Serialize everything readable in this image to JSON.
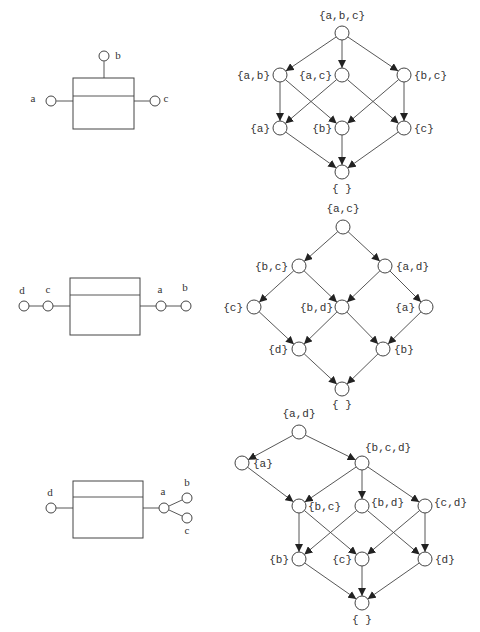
{
  "figures": [
    {
      "id": "fig1",
      "component": {
        "box": {
          "x": 73,
          "y": 78,
          "w": 61,
          "h": 51,
          "divider_y": 96
        },
        "ports": [
          {
            "name": "a",
            "x": 51,
            "y": 101,
            "label_x": 33,
            "label_y": 102,
            "attach": {
              "x": 73,
              "y": 101
            }
          },
          {
            "name": "b",
            "x": 104,
            "y": 56,
            "label_x": 118,
            "label_y": 59,
            "attach": {
              "x": 104,
              "y": 78
            }
          },
          {
            "name": "c",
            "x": 155,
            "y": 101,
            "label_x": 166,
            "label_y": 102,
            "attach": {
              "x": 134,
              "y": 101
            }
          }
        ],
        "chains": []
      },
      "lattice": {
        "nodes": [
          {
            "id": "abc",
            "label": "{a,b,c}",
            "x": 342,
            "y": 33,
            "lx": 342,
            "ly": 19,
            "anchor": "middle"
          },
          {
            "id": "ab",
            "label": "{a,b}",
            "x": 280,
            "y": 75,
            "lx": 270,
            "ly": 79,
            "anchor": "end"
          },
          {
            "id": "ac",
            "label": "{a,c}",
            "x": 342,
            "y": 75,
            "lx": 332,
            "ly": 79,
            "anchor": "end"
          },
          {
            "id": "bc",
            "label": "{b,c}",
            "x": 404,
            "y": 75,
            "lx": 414,
            "ly": 79,
            "anchor": "start"
          },
          {
            "id": "a",
            "label": "{a}",
            "x": 280,
            "y": 128,
            "lx": 270,
            "ly": 132,
            "anchor": "end"
          },
          {
            "id": "b",
            "label": "{b}",
            "x": 342,
            "y": 128,
            "lx": 332,
            "ly": 132,
            "anchor": "end"
          },
          {
            "id": "c",
            "label": "{c}",
            "x": 404,
            "y": 128,
            "lx": 414,
            "ly": 132,
            "anchor": "start"
          },
          {
            "id": "empty",
            "label": "{ }",
            "x": 342,
            "y": 172,
            "lx": 342,
            "ly": 192,
            "anchor": "middle"
          }
        ],
        "edges": [
          [
            "abc",
            "ab"
          ],
          [
            "abc",
            "ac"
          ],
          [
            "abc",
            "bc"
          ],
          [
            "ab",
            "a"
          ],
          [
            "ab",
            "b"
          ],
          [
            "ac",
            "a"
          ],
          [
            "ac",
            "c"
          ],
          [
            "bc",
            "b"
          ],
          [
            "bc",
            "c"
          ],
          [
            "a",
            "empty"
          ],
          [
            "b",
            "empty"
          ],
          [
            "c",
            "empty"
          ]
        ]
      }
    },
    {
      "id": "fig2",
      "component": {
        "box": {
          "x": 70,
          "y": 278,
          "w": 70,
          "h": 57,
          "divider_y": 295
        },
        "ports": [
          {
            "name": "d",
            "x": 24,
            "y": 306,
            "label_x": 22,
            "label_y": 294
          },
          {
            "name": "c",
            "x": 48,
            "y": 306,
            "label_x": 48,
            "label_y": 293
          },
          {
            "name": "a",
            "x": 161,
            "y": 306,
            "label_x": 160,
            "label_y": 293
          },
          {
            "name": "b",
            "x": 186,
            "y": 306,
            "label_x": 185,
            "label_y": 291
          }
        ],
        "chains": [
          {
            "x1": 29,
            "y1": 306,
            "x2": 43,
            "y2": 306
          },
          {
            "x1": 53,
            "y1": 306,
            "x2": 70,
            "y2": 306
          },
          {
            "x1": 140,
            "y1": 306,
            "x2": 156,
            "y2": 306
          },
          {
            "x1": 166,
            "y1": 306,
            "x2": 181,
            "y2": 306
          }
        ]
      },
      "lattice": {
        "nodes": [
          {
            "id": "ac",
            "label": "{a,c}",
            "x": 343,
            "y": 227,
            "lx": 343,
            "ly": 212,
            "anchor": "middle"
          },
          {
            "id": "bc",
            "label": "{b,c}",
            "x": 299,
            "y": 266,
            "lx": 288,
            "ly": 270,
            "anchor": "end"
          },
          {
            "id": "ad",
            "label": "{a,d}",
            "x": 385,
            "y": 266,
            "lx": 396,
            "ly": 270,
            "anchor": "start"
          },
          {
            "id": "c",
            "label": "{c}",
            "x": 254,
            "y": 307,
            "lx": 243,
            "ly": 311,
            "anchor": "end"
          },
          {
            "id": "bd",
            "label": "{b,d}",
            "x": 342,
            "y": 307,
            "lx": 333,
            "ly": 311,
            "anchor": "end"
          },
          {
            "id": "a",
            "label": "{a}",
            "x": 426,
            "y": 307,
            "lx": 415,
            "ly": 311,
            "anchor": "end"
          },
          {
            "id": "d",
            "label": "{d}",
            "x": 299,
            "y": 349,
            "lx": 288,
            "ly": 353,
            "anchor": "end"
          },
          {
            "id": "b",
            "label": "{b}",
            "x": 383,
            "y": 349,
            "lx": 394,
            "ly": 353,
            "anchor": "start"
          },
          {
            "id": "empty",
            "label": "{ }",
            "x": 342,
            "y": 389,
            "lx": 342,
            "ly": 408,
            "anchor": "middle"
          }
        ],
        "edges": [
          [
            "ac",
            "bc"
          ],
          [
            "ac",
            "ad"
          ],
          [
            "bc",
            "c"
          ],
          [
            "bc",
            "bd"
          ],
          [
            "ad",
            "bd"
          ],
          [
            "ad",
            "a"
          ],
          [
            "c",
            "d"
          ],
          [
            "bd",
            "d"
          ],
          [
            "bd",
            "b"
          ],
          [
            "a",
            "b"
          ],
          [
            "d",
            "empty"
          ],
          [
            "b",
            "empty"
          ]
        ]
      }
    },
    {
      "id": "fig3",
      "component": {
        "box": {
          "x": 73,
          "y": 481,
          "w": 70,
          "h": 57,
          "divider_y": 497
        },
        "ports": [
          {
            "name": "d",
            "x": 51,
            "y": 508,
            "label_x": 50,
            "label_y": 496
          },
          {
            "name": "a",
            "x": 164,
            "y": 508,
            "label_x": 163,
            "label_y": 495
          },
          {
            "name": "b",
            "x": 187,
            "y": 498,
            "label_x": 187,
            "label_y": 486
          },
          {
            "name": "c",
            "x": 187,
            "y": 518,
            "label_x": 187,
            "label_y": 534
          }
        ],
        "chains": [
          {
            "x1": 56,
            "y1": 508,
            "x2": 73,
            "y2": 508
          },
          {
            "x1": 143,
            "y1": 508,
            "x2": 159,
            "y2": 508
          },
          {
            "x1": 169,
            "y1": 506,
            "x2": 182,
            "y2": 500
          },
          {
            "x1": 169,
            "y1": 510,
            "x2": 182,
            "y2": 516
          }
        ]
      },
      "lattice": {
        "nodes": [
          {
            "id": "ad",
            "label": "{a,d}",
            "x": 299,
            "y": 432,
            "lx": 299,
            "ly": 417,
            "anchor": "middle"
          },
          {
            "id": "a",
            "label": "{a}",
            "x": 242,
            "y": 463,
            "lx": 253,
            "ly": 467,
            "anchor": "start"
          },
          {
            "id": "bcd",
            "label": "{b,c,d}",
            "x": 362,
            "y": 463,
            "lx": 365,
            "ly": 451,
            "anchor": "start"
          },
          {
            "id": "bc",
            "label": "{b,c}",
            "x": 299,
            "y": 506,
            "lx": 308,
            "ly": 510,
            "anchor": "start"
          },
          {
            "id": "bd",
            "label": "{b,d}",
            "x": 362,
            "y": 506,
            "lx": 371,
            "ly": 506,
            "anchor": "start"
          },
          {
            "id": "cd",
            "label": "{c,d}",
            "x": 425,
            "y": 506,
            "lx": 434,
            "ly": 506,
            "anchor": "start"
          },
          {
            "id": "b",
            "label": "{b}",
            "x": 299,
            "y": 559,
            "lx": 289,
            "ly": 563,
            "anchor": "end"
          },
          {
            "id": "c",
            "label": "{c}",
            "x": 362,
            "y": 559,
            "lx": 352,
            "ly": 563,
            "anchor": "end"
          },
          {
            "id": "d",
            "label": "{d}",
            "x": 425,
            "y": 559,
            "lx": 435,
            "ly": 563,
            "anchor": "start"
          },
          {
            "id": "empty",
            "label": "{ }",
            "x": 362,
            "y": 603,
            "lx": 362,
            "ly": 623,
            "anchor": "middle"
          }
        ],
        "edges": [
          [
            "ad",
            "a"
          ],
          [
            "ad",
            "bcd"
          ],
          [
            "a",
            "bc"
          ],
          [
            "bcd",
            "bc"
          ],
          [
            "bcd",
            "bd"
          ],
          [
            "bcd",
            "cd"
          ],
          [
            "bc",
            "b"
          ],
          [
            "bc",
            "c"
          ],
          [
            "bd",
            "b"
          ],
          [
            "bd",
            "d"
          ],
          [
            "cd",
            "c"
          ],
          [
            "cd",
            "d"
          ],
          [
            "b",
            "empty"
          ],
          [
            "c",
            "empty"
          ],
          [
            "d",
            "empty"
          ]
        ]
      }
    }
  ],
  "style": {
    "node_radius": 7,
    "stroke_color": "#444444",
    "text_color": "#333333",
    "background": "#ffffff"
  }
}
